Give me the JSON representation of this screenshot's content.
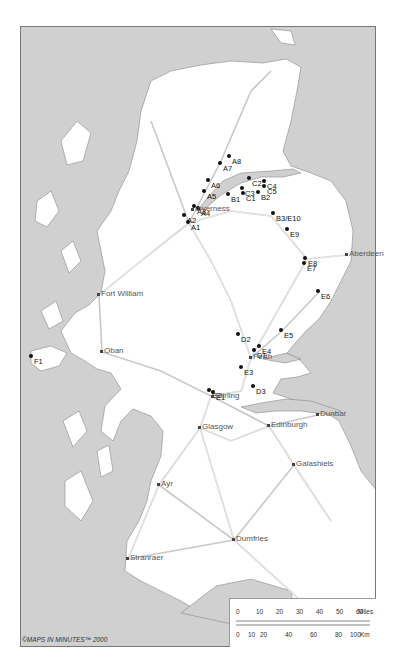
{
  "map": {
    "colors": {
      "sea": "#d0d0d0",
      "land": "#ffffff",
      "roads": "#c8c8c8",
      "points": "#111111"
    },
    "sites": [
      {
        "id": "A1",
        "x": 188,
        "y": 222
      },
      {
        "id": "A2",
        "x": 184,
        "y": 215
      },
      {
        "id": "A3",
        "x": 194,
        "y": 206
      },
      {
        "id": "A4",
        "x": 198,
        "y": 208
      },
      {
        "id": "A5",
        "x": 204,
        "y": 191
      },
      {
        "id": "A6",
        "x": 208,
        "y": 180
      },
      {
        "id": "A7",
        "x": 220,
        "y": 163
      },
      {
        "id": "A8",
        "x": 229,
        "y": 156
      },
      {
        "id": "B1",
        "x": 228,
        "y": 194
      },
      {
        "id": "B2",
        "x": 258,
        "y": 192
      },
      {
        "id": "B3/E10",
        "x": 273,
        "y": 213
      },
      {
        "id": "C1",
        "x": 243,
        "y": 193
      },
      {
        "id": "C2",
        "x": 249,
        "y": 178
      },
      {
        "id": "C3",
        "x": 242,
        "y": 188
      },
      {
        "id": "C4",
        "x": 264,
        "y": 181
      },
      {
        "id": "C5",
        "x": 264,
        "y": 186
      },
      {
        "id": "D1",
        "x": 254,
        "y": 350
      },
      {
        "id": "D2",
        "x": 238,
        "y": 334
      },
      {
        "id": "D3",
        "x": 253,
        "y": 386
      },
      {
        "id": "E1",
        "x": 213,
        "y": 392
      },
      {
        "id": "E2",
        "x": 209,
        "y": 390
      },
      {
        "id": "E3",
        "x": 241,
        "y": 367
      },
      {
        "id": "E4",
        "x": 259,
        "y": 346
      },
      {
        "id": "E5",
        "x": 281,
        "y": 330
      },
      {
        "id": "E6",
        "x": 318,
        "y": 291
      },
      {
        "id": "E7",
        "x": 304,
        "y": 263
      },
      {
        "id": "E8",
        "x": 305,
        "y": 258
      },
      {
        "id": "E9",
        "x": 287,
        "y": 229
      },
      {
        "id": "F1",
        "x": 31,
        "y": 356
      }
    ],
    "towns": [
      {
        "name": "Inverness",
        "x": 192,
        "y": 209
      },
      {
        "name": "Aberdeen",
        "x": 346,
        "y": 254
      },
      {
        "name": "Fort William",
        "x": 98,
        "y": 294
      },
      {
        "name": "Oban",
        "x": 101,
        "y": 351
      },
      {
        "name": "Perth",
        "x": 250,
        "y": 357
      },
      {
        "name": "Stirling",
        "x": 212,
        "y": 396
      },
      {
        "name": "Dunbar",
        "x": 317,
        "y": 414
      },
      {
        "name": "Edinburgh",
        "x": 268,
        "y": 425
      },
      {
        "name": "Glasgow",
        "x": 199,
        "y": 427
      },
      {
        "name": "Galashiels",
        "x": 293,
        "y": 464
      },
      {
        "name": "Ayr",
        "x": 158,
        "y": 484
      },
      {
        "name": "Dumfries",
        "x": 233,
        "y": 539
      },
      {
        "name": "Stranraer",
        "x": 127,
        "y": 558
      }
    ],
    "copyright": "©MAPS IN MINUTES™ 2000",
    "scale": {
      "miles_label": "Miles",
      "km_label": "Km",
      "miles_ticks": [
        "0",
        "10",
        "20",
        "30",
        "40",
        "50",
        "60"
      ],
      "km_ticks": [
        "0",
        "10",
        "20",
        "40",
        "60",
        "80",
        "100"
      ]
    }
  }
}
